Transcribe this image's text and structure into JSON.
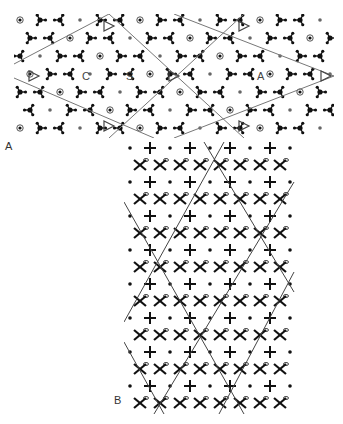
{
  "figure": {
    "panels": [
      {
        "id": "A",
        "label": "A",
        "site_labels": [
          "C",
          "S",
          "A"
        ]
      },
      {
        "id": "B",
        "label": "B"
      }
    ],
    "colors": {
      "ink": "#111111",
      "line": "#777777",
      "background": "#ffffff"
    }
  }
}
